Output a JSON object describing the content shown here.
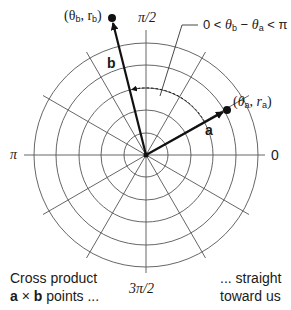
{
  "diagram": {
    "type": "polar-coordinate-vector-diagram",
    "axis_labels": {
      "angle_0": "0",
      "angle_pi_over_2": "π/2",
      "angle_pi": "π",
      "angle_3pi_over_2": "3π/2"
    },
    "vectors": [
      {
        "name": "a",
        "label": "a",
        "point_label_theta": "θ",
        "point_label_r": "r",
        "subscript": "a"
      },
      {
        "name": "b",
        "label": "b",
        "point_label_theta": "θ",
        "point_label_r": "r",
        "subscript": "b"
      }
    ],
    "condition_label": {
      "prefix": "0 < ",
      "theta_b": "θ",
      "sub_b": "b",
      "minus": " − ",
      "theta_a": "θ",
      "sub_a": "a",
      "suffix": " < π"
    },
    "caption_left": {
      "line1": "Cross product",
      "line2_bold_a": "a",
      "line2_times": " × ",
      "line2_bold_b": "b",
      "line2_rest": " points ..."
    },
    "caption_right": {
      "line1": "... straight",
      "line2": "toward us"
    },
    "grid": {
      "circles": 5,
      "spoke_angle_step_deg": 30
    },
    "colors": {
      "grid": "#555555",
      "vector": "#111111",
      "text": "#1a1a1a"
    }
  }
}
